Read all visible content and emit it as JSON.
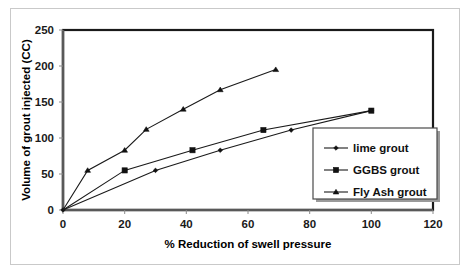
{
  "chart_data": {
    "type": "line",
    "title": "",
    "xlabel": "% Reduction of swell pressure",
    "ylabel": "Volume of grout injected (CC)",
    "xlim": [
      0,
      120
    ],
    "ylim": [
      0,
      250
    ],
    "xticks": [
      0,
      20,
      40,
      60,
      80,
      100,
      120
    ],
    "yticks": [
      0,
      50,
      100,
      150,
      200,
      250
    ],
    "grid": false,
    "legend_position": "inside-bottom-right",
    "series": [
      {
        "name": "lime grout",
        "marker": "diamond",
        "x": [
          0,
          30,
          51,
          74,
          100
        ],
        "y": [
          0,
          55,
          83,
          111,
          138
        ]
      },
      {
        "name": "GGBS grout",
        "marker": "square",
        "x": [
          0,
          20,
          42,
          65,
          100
        ],
        "y": [
          0,
          55,
          83,
          111,
          138
        ]
      },
      {
        "name": "Fly Ash grout",
        "marker": "triangle",
        "x": [
          0,
          8,
          20,
          27,
          39,
          51,
          69
        ],
        "y": [
          0,
          55,
          83,
          112,
          140,
          167,
          195
        ]
      }
    ]
  },
  "axes": {
    "x_tick_labels": [
      "0",
      "20",
      "40",
      "60",
      "80",
      "100",
      "120"
    ],
    "y_tick_labels": [
      "0",
      "50",
      "100",
      "150",
      "200",
      "250"
    ],
    "x_axis_title": "% Reduction of swell pressure",
    "y_axis_title": "Volume of grout injected (CC)"
  },
  "legend": {
    "entries": [
      {
        "label": "lime grout",
        "marker": "diamond"
      },
      {
        "label": "GGBS grout",
        "marker": "square"
      },
      {
        "label": "Fly Ash grout",
        "marker": "triangle"
      }
    ]
  },
  "colors": {
    "series_stroke": "#1a1a1a",
    "marker_fill": "#111111",
    "axis": "#595959",
    "plot_border": "#1a1a1a",
    "outer_frame": "#c9c9c9",
    "background": "#ffffff"
  }
}
